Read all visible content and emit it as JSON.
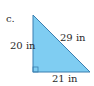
{
  "problem": {
    "label": "c."
  },
  "triangle": {
    "type": "right-triangle",
    "fill_color": "#7fcdf2",
    "stroke_color": "#3a7fb0",
    "sides": {
      "vertical_leg": "20 in",
      "horizontal_leg": "21 in",
      "hypotenuse": "29 in"
    },
    "right_angle_marker": true
  }
}
